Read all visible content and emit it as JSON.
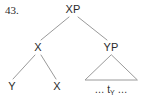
{
  "figure": {
    "item_number": "43.",
    "background_color": "#ffffff",
    "line_color": "#9a9a9a",
    "text_color": "#2b2b2b"
  },
  "tree": {
    "root": {
      "label": "XP",
      "x": 73,
      "y": 9
    },
    "left_child": {
      "label": "X",
      "x": 38,
      "y": 47
    },
    "right_child": {
      "label": "YP",
      "x": 111,
      "y": 47
    },
    "left_leaf_1": {
      "label": "Y",
      "x": 12,
      "y": 86
    },
    "left_leaf_2": {
      "label": "X",
      "x": 57,
      "y": 86
    },
    "triangle": {
      "apex_x": 111,
      "apex_y": 55,
      "base_left_x": 85,
      "base_right_x": 137,
      "base_y": 80
    },
    "trace": {
      "prefix": "…",
      "symbol": "t",
      "subscript": "Y",
      "suffix": "…",
      "x": 111,
      "y": 89
    }
  }
}
